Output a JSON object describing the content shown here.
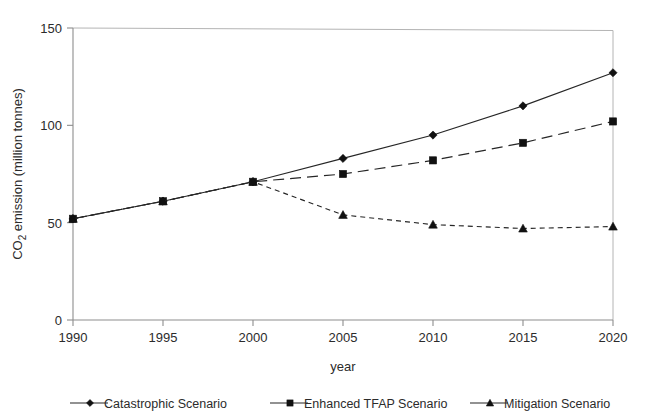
{
  "chart_data": {
    "type": "line",
    "title": "",
    "xlabel": "year",
    "ylabel": "CO2 emission (million tonnes)",
    "ylabel_parts": {
      "prefix": "CO",
      "sub": "2",
      "suffix": " emission (million tonnes)"
    },
    "x": [
      1990,
      1995,
      2000,
      2005,
      2010,
      2015,
      2020
    ],
    "xticklabels": [
      "1990",
      "1995",
      "2000",
      "2005",
      "2010",
      "2015",
      "2020"
    ],
    "yticks": [
      0,
      50,
      100,
      150
    ],
    "yticklabels": [
      "0",
      "50",
      "100",
      "150"
    ],
    "xlim": [
      1990,
      2020
    ],
    "ylim": [
      0,
      150
    ],
    "grid": false,
    "legend_position": "bottom",
    "series": [
      {
        "name": "Catastrophic Scenario",
        "marker": "diamond",
        "linestyle": "solid",
        "color": "#262626",
        "values": [
          52,
          61,
          71,
          83,
          95,
          110,
          127
        ]
      },
      {
        "name": "Enhanced TFAP Scenario",
        "marker": "square",
        "linestyle": "long-dash",
        "color": "#262626",
        "values": [
          52,
          61,
          71,
          75,
          82,
          91,
          102
        ]
      },
      {
        "name": "Mitigation Scenario",
        "marker": "triangle",
        "linestyle": "short-dash",
        "color": "#262626",
        "values": [
          52,
          61,
          71,
          54,
          49,
          47,
          48
        ]
      }
    ]
  },
  "legend": {
    "items": [
      {
        "label": "Catastrophic Scenario",
        "marker": "diamond"
      },
      {
        "label": "Enhanced TFAP Scenario",
        "marker": "square"
      },
      {
        "label": "Mitigation Scenario",
        "marker": "triangle"
      }
    ]
  }
}
